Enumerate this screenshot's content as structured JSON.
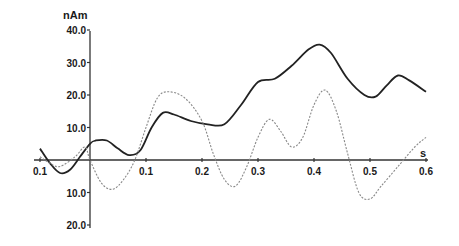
{
  "chart_data": {
    "type": "line",
    "title": "",
    "ylabel": "nAm",
    "xlabel": "s",
    "xlim": [
      -0.1,
      0.6
    ],
    "ylim": [
      -20,
      40
    ],
    "grid": false,
    "legend": null,
    "x_ticks": [
      {
        "value": -0.1,
        "label": "0.1"
      },
      {
        "value": 0.1,
        "label": "0.1"
      },
      {
        "value": 0.2,
        "label": "0.2"
      },
      {
        "value": 0.3,
        "label": "0.3"
      },
      {
        "value": 0.4,
        "label": "0.4"
      },
      {
        "value": 0.5,
        "label": "0.5"
      },
      {
        "value": 0.6,
        "label": "0.6"
      }
    ],
    "y_ticks_above": [
      {
        "value": 40,
        "label": "40.0"
      },
      {
        "value": 30,
        "label": "30.0"
      },
      {
        "value": 20,
        "label": "20.0"
      },
      {
        "value": 10,
        "label": "10.0"
      }
    ],
    "y_ticks_below": [
      {
        "value": -10,
        "label": "10.0"
      },
      {
        "value": -20,
        "label": "20.0"
      }
    ],
    "series": [
      {
        "name": "solid",
        "style": "solid",
        "color": "#222222",
        "x": [
          -0.1,
          -0.08,
          -0.06,
          -0.04,
          -0.02,
          0.0,
          0.01,
          0.03,
          0.05,
          0.07,
          0.09,
          0.11,
          0.13,
          0.15,
          0.18,
          0.21,
          0.24,
          0.27,
          0.3,
          0.33,
          0.36,
          0.39,
          0.41,
          0.43,
          0.46,
          0.49,
          0.51,
          0.53,
          0.55,
          0.57,
          0.6
        ],
        "y": [
          3.5,
          -1,
          -4,
          -3,
          1,
          5,
          6,
          6,
          3.5,
          1.5,
          3,
          10,
          14.5,
          14,
          12,
          11,
          11,
          17,
          24,
          25,
          29,
          34,
          35.5,
          33,
          25,
          20,
          19.5,
          23,
          26,
          24.5,
          21
        ]
      },
      {
        "name": "dashed",
        "style": "dotted",
        "color": "#888888",
        "x": [
          -0.1,
          -0.08,
          -0.06,
          -0.03,
          -0.01,
          0.0,
          0.02,
          0.04,
          0.06,
          0.08,
          0.1,
          0.12,
          0.14,
          0.17,
          0.2,
          0.22,
          0.24,
          0.26,
          0.28,
          0.3,
          0.32,
          0.34,
          0.36,
          0.38,
          0.4,
          0.42,
          0.44,
          0.46,
          0.48,
          0.5,
          0.52,
          0.55,
          0.58,
          0.6
        ],
        "y": [
          1,
          -1,
          -2,
          1,
          4,
          0,
          -7,
          -9,
          -6,
          0,
          10,
          19,
          21,
          19,
          12,
          2,
          -6,
          -8,
          -2,
          7,
          12.5,
          9,
          4,
          7,
          17,
          21.5,
          15,
          2,
          -10,
          -12,
          -8,
          -2,
          4,
          7
        ]
      }
    ]
  }
}
